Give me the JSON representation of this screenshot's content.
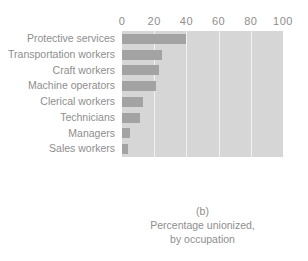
{
  "chart_data": {
    "type": "bar",
    "orientation": "horizontal",
    "title": "",
    "subtitle": "",
    "xlabel": "",
    "ylabel": "",
    "xlim": [
      0,
      100
    ],
    "ylim": null,
    "grid": true,
    "legend": null,
    "categories": [
      "Protective services",
      "Transportation workers",
      "Craft workers",
      "Machine operators",
      "Clerical workers",
      "Technicians",
      "Managers",
      "Sales workers"
    ],
    "values": [
      40,
      25,
      23,
      21,
      13,
      11,
      5,
      4
    ],
    "x_ticks": [
      0,
      20,
      40,
      60,
      80,
      100
    ],
    "x_tick_labels": [
      "0",
      "20",
      "40",
      "60",
      "80",
      "100"
    ],
    "colors": {
      "bar": "#a3a3a3",
      "plot_background": "#d6d6d6",
      "gridline": "#f2f2f2",
      "text": "#8e8e8e",
      "page_background": "#ffffff"
    }
  },
  "caption": {
    "letter": "(b)",
    "line1": "Percentage unionized,",
    "line2": "by occupation"
  }
}
